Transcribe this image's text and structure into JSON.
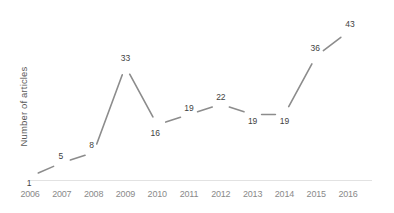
{
  "chart_data": {
    "type": "line",
    "title": "",
    "xlabel": "",
    "ylabel": "Number of articles",
    "categories": [
      "2006",
      "2007",
      "2008",
      "2009",
      "2010",
      "2011",
      "2012",
      "2013",
      "2014",
      "2015",
      "2016"
    ],
    "values": [
      1,
      5,
      8,
      33,
      16,
      19,
      22,
      19,
      19,
      36,
      43
    ],
    "data_labels": [
      "1",
      "5",
      "8",
      "33",
      "16",
      "19",
      "22",
      "19",
      "19",
      "36",
      "43"
    ],
    "ylim": [
      0,
      45
    ],
    "grid": false,
    "legend": "none",
    "series": [
      {
        "name": "Number of articles",
        "values": [
          1,
          5,
          8,
          33,
          16,
          19,
          22,
          19,
          19,
          36,
          43
        ]
      }
    ],
    "colors": {
      "line": "#8c8c8c",
      "data_label": "#3f3f3f",
      "tick_label": "#8a8a8a",
      "axis_line": "#e2e2e2",
      "axis_title": "#595959",
      "background": "#ffffff"
    }
  }
}
